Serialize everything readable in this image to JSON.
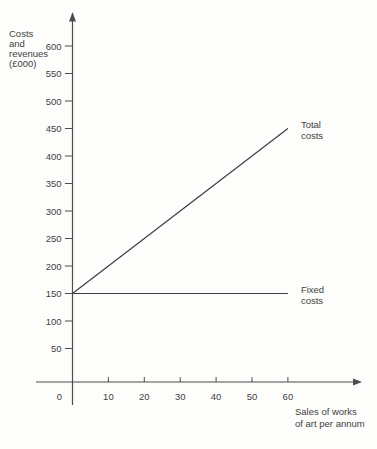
{
  "chart_data": {
    "type": "line",
    "title": "",
    "ylabel": "Costs\nand\nrevenues\n(£000)",
    "xlabel": "Sales of works\nof art per annum",
    "x_ticks": [
      0,
      10,
      20,
      30,
      40,
      50,
      60
    ],
    "y_ticks": [
      50,
      100,
      150,
      200,
      250,
      300,
      350,
      400,
      450,
      500,
      550,
      600
    ],
    "xlim": [
      0,
      68
    ],
    "ylim": [
      0,
      660
    ],
    "grid": false,
    "legend_position": "labels-at-line-ends",
    "series": [
      {
        "name": "Total costs",
        "label": "Total\ncosts",
        "x": [
          0,
          60
        ],
        "y": [
          150,
          450
        ]
      },
      {
        "name": "Fixed costs",
        "label": "Fixed\ncosts",
        "x": [
          0,
          60
        ],
        "y": [
          150,
          150
        ]
      }
    ],
    "colors": {
      "line": "#3f3f3f",
      "axis": "#4d4d4d",
      "text": "#414141",
      "background": "#fdfdfb"
    }
  }
}
